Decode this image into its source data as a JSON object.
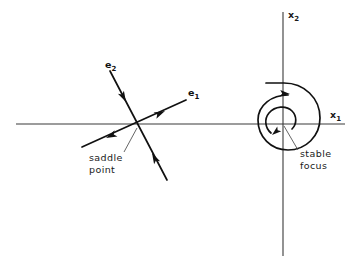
{
  "figure": {
    "background_color": "#ffffff",
    "line_color": "#111111",
    "axis_color": "#3a3a3a",
    "leader_color": "#555555"
  },
  "axes": {
    "horizontal": {
      "name": "x1-axis",
      "label_base": "x",
      "label_sub": "1",
      "y": 124,
      "x_start": 16,
      "x_end": 345,
      "label_x": 330,
      "label_y": 118
    },
    "vertical": {
      "name": "x2-axis",
      "label_base": "x",
      "label_sub": "2",
      "x": 283,
      "y_start": 12,
      "y_end": 256,
      "label_x": 288,
      "label_y": 18
    }
  },
  "saddle": {
    "name": "saddle-point",
    "origin_x": 139,
    "origin_y": 124,
    "annotation": {
      "line1": "saddle",
      "line2": "point",
      "x": 89,
      "y1": 161,
      "y2": 173,
      "leader_from_x": 124,
      "leader_from_y": 152,
      "leader_to_x": 137,
      "leader_to_y": 128
    },
    "eigenvectors": [
      {
        "name": "e1",
        "label_base": "e",
        "label_sub": "1",
        "label_x": 188,
        "label_y": 96,
        "direction": "unstable-outward",
        "x1": 82,
        "y1": 147,
        "x2": 186,
        "y2": 100
      },
      {
        "name": "e2",
        "label_base": "e",
        "label_sub": "2",
        "label_x": 105,
        "label_y": 68,
        "direction": "stable-inward",
        "x1": 110,
        "y1": 71,
        "x2": 167,
        "y2": 180
      }
    ],
    "arrows": [
      {
        "name": "e1-arrow-outward-upper",
        "x": 165,
        "y": 111,
        "angle": -24.3
      },
      {
        "name": "e1-arrow-outward-lower",
        "x": 106,
        "y": 138,
        "angle": 155.7
      },
      {
        "name": "e2-arrow-inward-upper",
        "x": 126,
        "y": 102,
        "angle": 62.4
      },
      {
        "name": "e2-arrow-inward-lower",
        "x": 152,
        "y": 153,
        "angle": -117.6
      }
    ]
  },
  "focus": {
    "name": "stable-focus",
    "center_x": 283,
    "center_y": 124,
    "rotation": "clockwise-inward",
    "annotation": {
      "line1": "stable",
      "line2": "focus",
      "x": 300,
      "y1": 157,
      "y2": 169,
      "leader_from_x": 298,
      "leader_from_y": 150,
      "leader_to_x": 284,
      "leader_to_y": 126
    },
    "arrows": [
      {
        "name": "spiral-arrow-outer-top",
        "x": 287,
        "y": 95,
        "angle": 5
      },
      {
        "name": "spiral-arrow-inner-left",
        "x": 270,
        "y": 134,
        "angle": 135
      }
    ]
  }
}
